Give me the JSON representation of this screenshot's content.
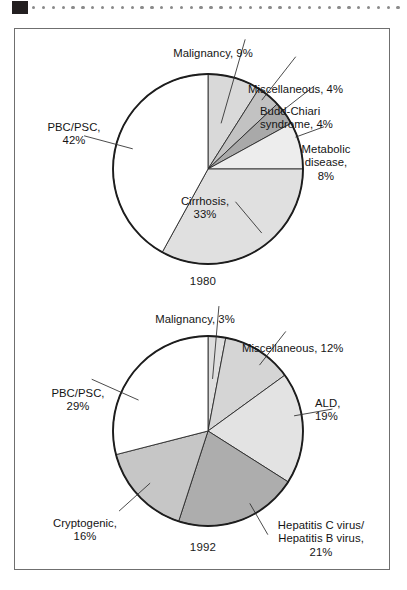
{
  "decoration": {
    "corner_block": "black-square",
    "dot_count": 38,
    "dot_color": "#8a8a8a"
  },
  "chart_data": [
    {
      "type": "pie",
      "title": "",
      "caption": "1980",
      "legend_position": "callout-labels",
      "start_angle_deg": 0,
      "direction": "clockwise",
      "categories": [
        "Malignancy",
        "Miscellaneous",
        "Budd-Chiari syndrome",
        "Metabolic disease",
        "Cirrhosis",
        "PBC/PSC"
      ],
      "values": [
        9,
        4,
        4,
        8,
        33,
        42
      ],
      "unit": "%",
      "colors": [
        "#d9d9d9",
        "#c2c2c2",
        "#a9a9a9",
        "#ededed",
        "#e0e0e0",
        "#ffffff"
      ],
      "labels": [
        {
          "name": "Malignancy",
          "value": 9,
          "text": "Malignancy, 9%"
        },
        {
          "name": "Miscellaneous",
          "value": 4,
          "text": "Miscellaneous, 4%"
        },
        {
          "name": "Budd-Chiari syndrome",
          "value": 4,
          "text": "Budd-Chiari\nsyndrome, 4%"
        },
        {
          "name": "Metabolic disease",
          "value": 8,
          "text": "Metabolic\ndisease,\n8%"
        },
        {
          "name": "Cirrhosis",
          "value": 33,
          "text": "Cirrhosis,\n33%"
        },
        {
          "name": "PBC/PSC",
          "value": 42,
          "text": "PBC/PSC,\n42%"
        }
      ]
    },
    {
      "type": "pie",
      "title": "",
      "caption": "1992",
      "legend_position": "callout-labels",
      "start_angle_deg": 0,
      "direction": "clockwise",
      "categories": [
        "Malignancy",
        "Miscellaneous",
        "ALD",
        "Hepatitis C virus/Hepatitis B virus",
        "Cryptogenic",
        "PBC/PSC"
      ],
      "values": [
        3,
        12,
        19,
        21,
        16,
        29
      ],
      "unit": "%",
      "colors": [
        "#dedede",
        "#d5d5d5",
        "#e3e3e3",
        "#adadad",
        "#c6c6c6",
        "#ffffff"
      ],
      "labels": [
        {
          "name": "Malignancy",
          "value": 3,
          "text": "Malignancy, 3%"
        },
        {
          "name": "Miscellaneous",
          "value": 12,
          "text": "Miscellaneous, 12%"
        },
        {
          "name": "ALD",
          "value": 19,
          "text": "ALD,\n19%"
        },
        {
          "name": "Hepatitis C virus/Hepatitis B virus",
          "value": 21,
          "text": "Hepatitis C virus/\nHepatitis B virus,\n21%"
        },
        {
          "name": "Cryptogenic",
          "value": 16,
          "text": "Cryptogenic,\n16%"
        },
        {
          "name": "PBC/PSC",
          "value": 29,
          "text": "PBC/PSC,\n29%"
        }
      ]
    }
  ],
  "chart1": {
    "caption": "1980",
    "label_malignancy": "Malignancy, 9%",
    "label_miscellaneous": "Miscellaneous, 4%",
    "label_budd_chiari": "Budd-Chiari\nsyndrome, 4%",
    "label_metabolic": "Metabolic\ndisease,\n8%",
    "label_cirrhosis": "Cirrhosis,\n33%",
    "label_pbc_psc": "PBC/PSC,\n42%"
  },
  "chart2": {
    "caption": "1992",
    "label_malignancy": "Malignancy, 3%",
    "label_miscellaneous": "Miscellaneous, 12%",
    "label_ald": "ALD,\n19%",
    "label_hepatitis": "Hepatitis C virus/\nHepatitis B virus,\n21%",
    "label_cryptogenic": "Cryptogenic,\n16%",
    "label_pbc_psc": "PBC/PSC,\n29%"
  }
}
